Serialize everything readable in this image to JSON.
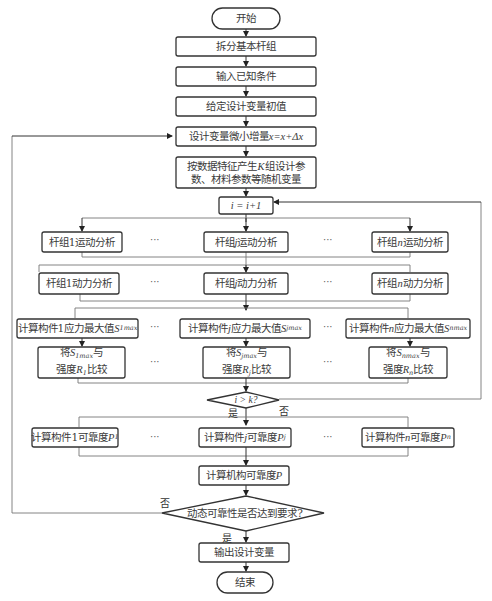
{
  "flowchart": {
    "start": "开始",
    "end": "结束",
    "steps": {
      "split_groups": "拆分基本杆组",
      "input_known": "输入已知条件",
      "init_vars": "给定设计变量初值",
      "increment": {
        "prefix": "设计变量微小增量",
        "formula": "x=x+Δx"
      },
      "random_vars": {
        "line1_a": "按数据特征产生",
        "k": "K",
        "line1_b": "组设计参",
        "line2": "数、材料参数等随机变量"
      },
      "counter": "i = i+1",
      "mech_reliability": {
        "text": "计算机构可靠度",
        "var": "P"
      },
      "output": "输出设计变量"
    },
    "columns": [
      {
        "kinematic": {
          "pre": "杆组",
          "idx": "1",
          "post": "运动分析"
        },
        "dynamic": {
          "pre": "杆组",
          "idx": "1",
          "post": "动力分析"
        },
        "stress": {
          "pre": "计算构件",
          "idx": "1",
          "post": "应力最大值",
          "sym": "S",
          "sub": "1max"
        },
        "compare": {
          "l1_pre": "将",
          "sym": "S",
          "sub": "1max",
          "l1_post": "与",
          "l2_pre": "强度",
          "rsym": "R",
          "rsub": "1",
          "l2_post": "比较"
        },
        "reliab": {
          "pre": "计算构件",
          "idx": "1",
          "post": "可靠度",
          "sym": "P",
          "sub": "1"
        }
      },
      {
        "kinematic": {
          "pre": "杆组",
          "idx": "j",
          "post": "运动分析"
        },
        "dynamic": {
          "pre": "杆组",
          "idx": "j",
          "post": "动力分析"
        },
        "stress": {
          "pre": "计算构件",
          "idx": "j",
          "post": "应力最大值",
          "sym": "S",
          "sub": "jmax"
        },
        "compare": {
          "l1_pre": "将",
          "sym": "S",
          "sub": "jmax",
          "l1_post": "与",
          "l2_pre": "强度",
          "rsym": "R",
          "rsub": "j",
          "l2_post": "比较"
        },
        "reliab": {
          "pre": "计算构件",
          "idx": "j",
          "post": "可靠度",
          "sym": "P",
          "sub": "j"
        }
      },
      {
        "kinematic": {
          "pre": "杆组",
          "idx": "n",
          "post": "运动分析"
        },
        "dynamic": {
          "pre": "杆组",
          "idx": "n",
          "post": "动力分析"
        },
        "stress": {
          "pre": "计算构件",
          "idx": "n",
          "post": "应力最大值",
          "sym": "S",
          "sub": "nmax"
        },
        "compare": {
          "l1_pre": "将",
          "sym": "S",
          "sub": "nmax",
          "l1_post": "与",
          "l2_pre": "强度",
          "rsym": "R",
          "rsub": "n",
          "l2_post": "比较"
        },
        "reliab": {
          "pre": "计算构件",
          "idx": "n",
          "post": "可靠度",
          "sym": "P",
          "sub": "n"
        }
      }
    ],
    "ellipsis": "···",
    "decisions": {
      "loop_check": {
        "text": "i > k?",
        "yes": "是",
        "no": "否"
      },
      "reliability_check": {
        "text": "动态可靠性是否达到要求?",
        "yes": "是",
        "no": "否"
      }
    }
  },
  "colors": {
    "box_stroke": "#333333",
    "line": "#777777",
    "background": "#ffffff"
  }
}
